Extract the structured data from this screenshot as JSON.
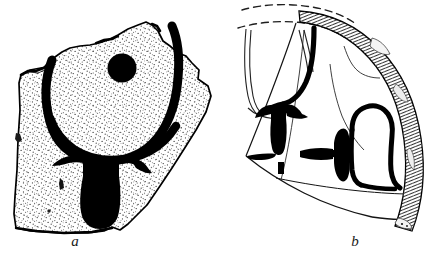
{
  "figure": {
    "background_color": "#ffffff",
    "ink_color": "#000000",
    "stipple_color": "#2b2b2b",
    "width": 445,
    "height": 259
  },
  "items": [
    {
      "id": "sherd-a",
      "label": "a",
      "label_x": 75,
      "label_y": 246,
      "description": "Irregular flat pottery sherd with stippled surface and a painted bucranium-like motif",
      "surface_fill": "#fdfdfd",
      "motifs": [
        {
          "name": "filled-disc",
          "kind": "dot",
          "cx": 122,
          "cy": 68,
          "r": 14
        },
        {
          "name": "curved-band",
          "kind": "thick-stroke"
        },
        {
          "name": "horned-pendant",
          "kind": "solid-shape"
        },
        {
          "name": "small-tick-mark",
          "kind": "short-stroke"
        }
      ]
    },
    {
      "id": "sherd-b",
      "label": "b",
      "label_x": 355,
      "label_y": 246,
      "description": "Curved rim sherd with cross-hatched rim band, dashed reconstruction lines, and two painted anchor motifs",
      "surface_fill": "#ffffff",
      "motifs": [
        {
          "name": "rim-band-hatched",
          "kind": "hatched-arc"
        },
        {
          "name": "reconstruction-dashes",
          "kind": "dashed-arc"
        },
        {
          "name": "anchor-motif-left",
          "kind": "solid-shape"
        },
        {
          "name": "anchor-motif-right",
          "kind": "solid-shape"
        },
        {
          "name": "bracket-outline-upper",
          "kind": "thick-stroke"
        },
        {
          "name": "bracket-outline-lower",
          "kind": "thick-stroke"
        },
        {
          "name": "crack-line",
          "kind": "thin-line"
        }
      ]
    }
  ]
}
